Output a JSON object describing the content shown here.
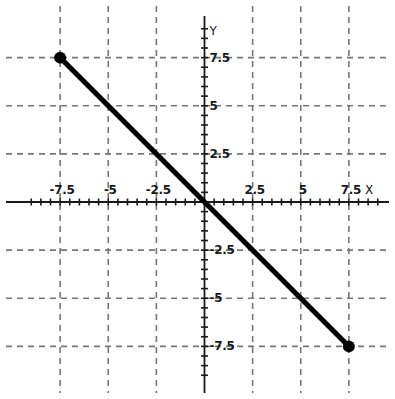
{
  "chart_data": {
    "type": "line",
    "title": "",
    "xlabel": "X",
    "ylabel": "Y",
    "xlim": [
      -9.0,
      9.0
    ],
    "ylim": [
      -9.0,
      9.0
    ],
    "grid": true,
    "grid_style": "dashed",
    "legend": "none",
    "xticks": [
      -7.5,
      -5,
      -2.5,
      2.5,
      5,
      7.5
    ],
    "yticks": [
      7.5,
      5,
      2.5,
      -2.5,
      -5,
      -7.5
    ],
    "xtick_labels": [
      "-7.5",
      "-5",
      "-2.5",
      "2.5",
      "5",
      "7.5"
    ],
    "ytick_labels": [
      "7.5",
      "5",
      "2.5",
      "-2.5",
      "-5",
      "-7.5"
    ],
    "minor_tick_spacing": 0.5,
    "series": [
      {
        "name": "segment",
        "kind": "line-segment",
        "equation": "y = -x",
        "slope": -1,
        "intercept": 0,
        "color": "#000000",
        "line_width": 5,
        "x": [
          -7.5,
          7.5
        ],
        "y": [
          7.5,
          -7.5
        ],
        "points": [
          {
            "x": -7.5,
            "y": 7.5,
            "marker": "filled-circle"
          },
          {
            "x": 7.5,
            "y": -7.5,
            "marker": "filled-circle"
          }
        ],
        "passes_through": [
          {
            "x": -2.5,
            "y": 2.5
          },
          {
            "x": 0,
            "y": 0
          },
          {
            "x": 2.5,
            "y": -2.5
          }
        ],
        "marker_size": 9
      }
    ],
    "colors": {
      "line": "#000000",
      "marker": "#000000",
      "axis": "#1a1a1a",
      "grid": "#777777",
      "background": "#ffffff",
      "text": "#1a1a1a"
    }
  },
  "axes": {
    "x_axis_name": "X",
    "y_axis_name": "Y"
  }
}
